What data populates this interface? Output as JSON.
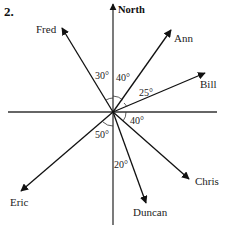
{
  "question_number": "2.",
  "compass": {
    "north_label": "North",
    "origin": [
      113,
      112
    ],
    "horizontal_axis": {
      "x1": 8,
      "x2": 217,
      "y": 112
    },
    "vertical_axis": {
      "y_top": 4,
      "y_bottom": 225
    }
  },
  "people": [
    {
      "name": "Fred",
      "tip": [
        62,
        28
      ],
      "label_pos": [
        36,
        33
      ],
      "bearing_deg": 330
    },
    {
      "name": "Ann",
      "tip": [
        171,
        30
      ],
      "label_pos": [
        174,
        42
      ],
      "bearing_deg": 40
    },
    {
      "name": "Bill",
      "tip": [
        205,
        73
      ],
      "label_pos": [
        200,
        88
      ],
      "bearing_deg": 65
    },
    {
      "name": "Chris",
      "tip": [
        189,
        179
      ],
      "label_pos": [
        195,
        185
      ],
      "bearing_deg": 130
    },
    {
      "name": "Duncan",
      "tip": [
        146,
        203
      ],
      "label_pos": [
        133,
        216
      ],
      "bearing_deg": 160
    },
    {
      "name": "Eric",
      "tip": [
        21,
        191
      ],
      "label_pos": [
        10,
        206
      ],
      "bearing_deg": 230
    }
  ],
  "angles": [
    {
      "label": "30°",
      "pos": [
        95,
        79
      ],
      "between": "North–Fred"
    },
    {
      "label": "40°",
      "pos": [
        116,
        81
      ],
      "between": "North–Ann"
    },
    {
      "label": "25°",
      "pos": [
        139,
        96
      ],
      "between": "Ann–Bill"
    },
    {
      "label": "40°",
      "pos": [
        130,
        124
      ],
      "between": "East–Chris"
    },
    {
      "label": "50°",
      "pos": [
        95,
        138
      ],
      "between": "South–Eric"
    },
    {
      "label": "20°",
      "pos": [
        114,
        168
      ],
      "between": "South–Duncan"
    }
  ]
}
